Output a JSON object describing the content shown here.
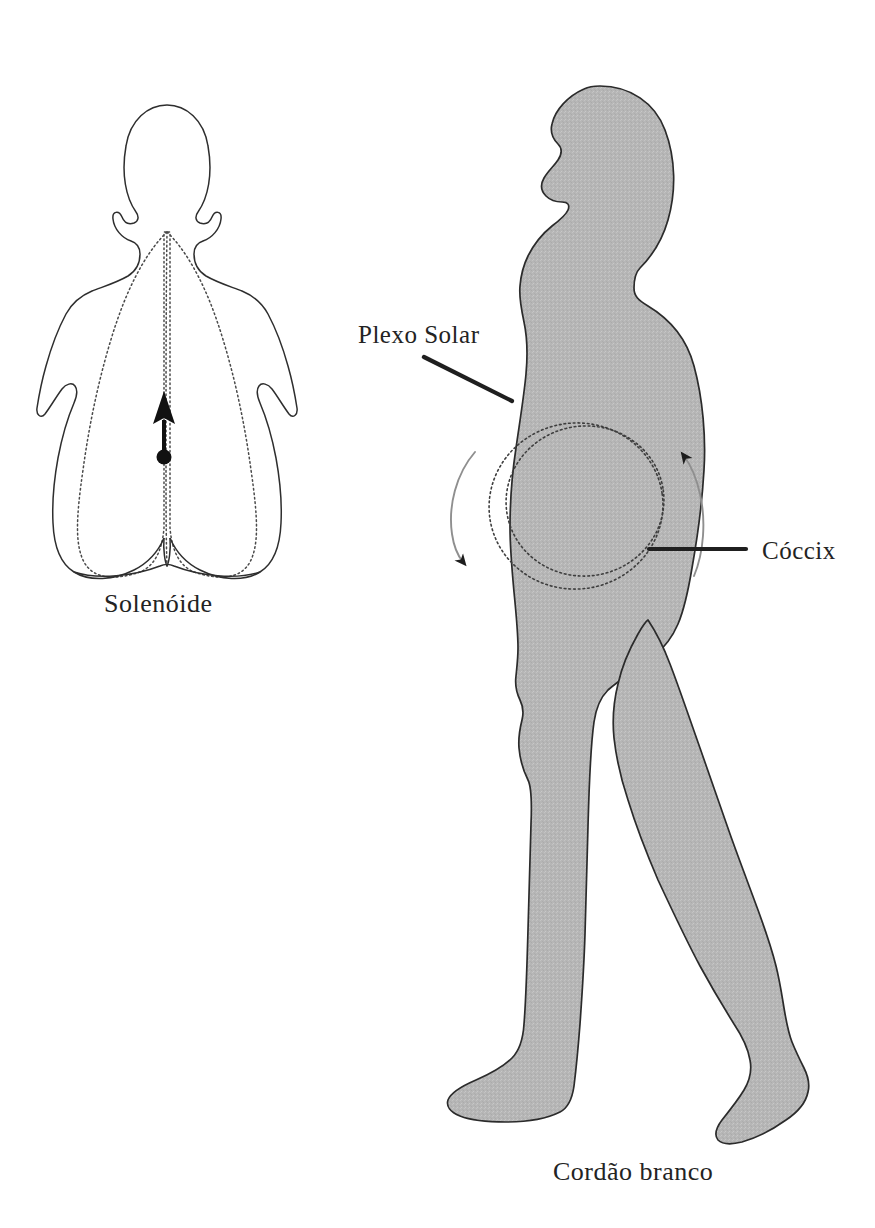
{
  "page": {
    "background_color": "#ffffff",
    "width": 875,
    "height": 1228,
    "language": "pt-BR"
  },
  "palette": {
    "body_fill": "#b6b6b6",
    "body_outline": "#2b2b2b",
    "dotted_line": "#4a4a4a",
    "solid_line": "#262626",
    "soft_arrow": "#8e8e8e",
    "text": "#232323"
  },
  "labels": {
    "solenoid": "Solenóide",
    "plexo_solar": "Plexo Solar",
    "coccix": "Cóccix",
    "cordao_branco": "Cordão branco"
  },
  "figures": {
    "left": {
      "name": "solenoid-body-diagram",
      "view": "anterior-torso-outline",
      "caption": "Solenóide",
      "elements": [
        "torso-outline",
        "dotted-field-loop-left",
        "dotted-field-loop-right",
        "central-dotted-axis",
        "upward-arrow",
        "origin-dot"
      ]
    },
    "right": {
      "name": "walking-figure-profile",
      "view": "lateral-profile-facing-left",
      "caption": "Cordão branco",
      "elements": [
        "silhouette",
        "dotted-ring-outer",
        "dotted-ring-inner",
        "curved-arrow-left-down",
        "curved-arrow-right-up",
        "leader-line-plexo-solar",
        "leader-line-coccix"
      ]
    }
  },
  "annotations": [
    {
      "id": "plexo-solar",
      "label": "Plexo Solar",
      "text_x": 358,
      "text_y": 343,
      "leader": {
        "x1": 424,
        "y1": 357,
        "x2": 512,
        "y2": 401
      }
    },
    {
      "id": "coccix",
      "label": "Cóccix",
      "text_x": 762,
      "text_y": 559,
      "leader": {
        "x1": 649,
        "y1": 549,
        "x2": 746,
        "y2": 549
      }
    },
    {
      "id": "solenoide",
      "label": "Solenóide",
      "text_x": 104,
      "text_y": 612
    },
    {
      "id": "cordao-branco",
      "label": "Cordão branco",
      "text_x": 553,
      "text_y": 1180
    }
  ],
  "rings": {
    "outer": {
      "cx": 576,
      "cy": 505,
      "rx": 86,
      "ry": 82,
      "rotation": -8
    },
    "inner": {
      "cx": 584,
      "cy": 501,
      "rx": 79,
      "ry": 76,
      "rotation": -8
    }
  },
  "solenoid_arrow": {
    "dot": {
      "cx": 164,
      "cy": 457,
      "r": 7
    },
    "shaft": {
      "x1": 164,
      "y1": 452,
      "x2": 164,
      "y2": 418
    },
    "head": {
      "tip_x": 164,
      "tip_y": 393,
      "half_width": 10,
      "length": 30
    }
  }
}
